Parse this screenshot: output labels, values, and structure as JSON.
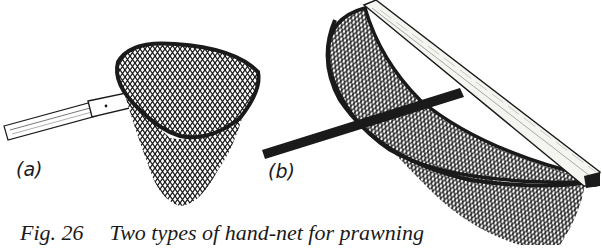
{
  "figure": {
    "number": "Fig. 26",
    "caption": "Two types of hand-net for prawning",
    "panels": [
      {
        "id": "a",
        "label": "(a)",
        "description": "hand-net with triangular rounded frame on tubular handle"
      },
      {
        "id": "b",
        "label": "(b)",
        "description": "push-net with straight wooden cross-bar and D-shaped frame"
      }
    ]
  },
  "colors": {
    "ink": "#1a1a1a",
    "paper": "#ffffff",
    "wood": "#f4f4f0"
  }
}
